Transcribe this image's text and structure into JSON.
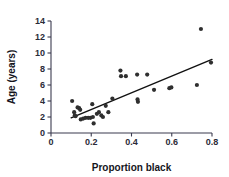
{
  "chart_data": {
    "type": "scatter",
    "title": "",
    "xlabel": "Proportion black",
    "ylabel": "Age (years)",
    "xlim": [
      0,
      0.8
    ],
    "ylim": [
      0,
      14
    ],
    "xticks": [
      "0",
      "0.2",
      "0.4",
      "0.6",
      "0.8"
    ],
    "xtick_values": [
      0,
      0.2,
      0.4,
      0.6,
      0.8
    ],
    "yticks": [
      "0",
      "2",
      "4",
      "6",
      "8",
      "10",
      "12",
      "14"
    ],
    "ytick_values": [
      0,
      2,
      4,
      6,
      8,
      10,
      12,
      14
    ],
    "grid": false,
    "legend": "none",
    "marker_color": "#2f2f2f",
    "line_color": "#111111",
    "axis_color": "#3b3b4f",
    "points": [
      {
        "x": 0.105,
        "y": 4.0
      },
      {
        "x": 0.115,
        "y": 2.6
      },
      {
        "x": 0.118,
        "y": 2.2
      },
      {
        "x": 0.122,
        "y": 2.1
      },
      {
        "x": 0.132,
        "y": 3.2
      },
      {
        "x": 0.14,
        "y": 3.1
      },
      {
        "x": 0.145,
        "y": 2.9
      },
      {
        "x": 0.148,
        "y": 1.7
      },
      {
        "x": 0.16,
        "y": 1.8
      },
      {
        "x": 0.172,
        "y": 1.9
      },
      {
        "x": 0.185,
        "y": 1.9
      },
      {
        "x": 0.196,
        "y": 1.9
      },
      {
        "x": 0.205,
        "y": 3.6
      },
      {
        "x": 0.208,
        "y": 2.0
      },
      {
        "x": 0.212,
        "y": 1.2
      },
      {
        "x": 0.228,
        "y": 2.4
      },
      {
        "x": 0.238,
        "y": 2.6
      },
      {
        "x": 0.25,
        "y": 2.2
      },
      {
        "x": 0.258,
        "y": 2.0
      },
      {
        "x": 0.272,
        "y": 3.4
      },
      {
        "x": 0.285,
        "y": 2.6
      },
      {
        "x": 0.305,
        "y": 4.3
      },
      {
        "x": 0.345,
        "y": 7.8
      },
      {
        "x": 0.348,
        "y": 7.1
      },
      {
        "x": 0.372,
        "y": 7.1
      },
      {
        "x": 0.428,
        "y": 7.3
      },
      {
        "x": 0.43,
        "y": 4.2
      },
      {
        "x": 0.432,
        "y": 3.9
      },
      {
        "x": 0.478,
        "y": 7.3
      },
      {
        "x": 0.512,
        "y": 5.4
      },
      {
        "x": 0.588,
        "y": 5.6
      },
      {
        "x": 0.598,
        "y": 5.7
      },
      {
        "x": 0.725,
        "y": 6.0
      },
      {
        "x": 0.745,
        "y": 13.0
      },
      {
        "x": 0.795,
        "y": 8.8
      }
    ],
    "fit_line": {
      "x0": 0.1,
      "y0": 1.9,
      "x1": 0.8,
      "y1": 9.2
    }
  }
}
